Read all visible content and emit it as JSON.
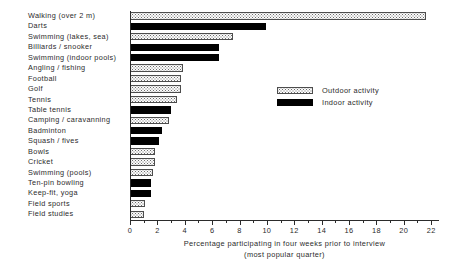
{
  "chart_data": {
    "type": "bar",
    "orientation": "horizontal",
    "title": "",
    "subtitle": "",
    "xlabel_line1": "Percentage participating in four weeks prior to interview",
    "xlabel_line2": "(most popular quarter)",
    "ylabel": "",
    "xlim": [
      0,
      22.5
    ],
    "xticks": [
      0,
      2,
      4,
      6,
      8,
      10,
      12,
      14,
      16,
      18,
      20,
      22
    ],
    "xtick_labels": [
      "0",
      "2",
      "4",
      "6",
      "8",
      "10",
      "12",
      "14",
      "16",
      "18",
      "20",
      "22"
    ],
    "minor_xticks": [
      1,
      3,
      5,
      7,
      9,
      11,
      13,
      15,
      17,
      19,
      21
    ],
    "grid": false,
    "legend_position": "upper right",
    "legend": [
      {
        "label": "Outdoor activity",
        "style": "outdoor"
      },
      {
        "label": "Indoor activity",
        "style": "indoor"
      }
    ],
    "categories": [
      "Walking (over 2 m)",
      "Darts",
      "Swimming (lakes, sea)",
      "Billiards / snooker",
      "Swimming (indoor pools)",
      "Angling / fishing",
      "Football",
      "Golf",
      "Tennis",
      "Table tennis",
      "Camping / caravanning",
      "Badminton",
      "Squash / fives",
      "Bowls",
      "Cricket",
      "Swimming (pools)",
      "Ten-pin bowling",
      "Keep-fit, yoga",
      "Field sports",
      "Field studies"
    ],
    "values": [
      21.6,
      9.9,
      7.5,
      6.5,
      6.5,
      3.9,
      3.7,
      3.7,
      3.4,
      3.0,
      2.85,
      2.35,
      2.15,
      1.85,
      1.85,
      1.65,
      1.55,
      1.55,
      1.1,
      1.05
    ],
    "bar_styles": [
      "outdoor",
      "indoor",
      "outdoor",
      "indoor",
      "indoor",
      "outdoor",
      "outdoor",
      "outdoor",
      "outdoor",
      "indoor",
      "outdoor",
      "indoor",
      "indoor",
      "outdoor",
      "outdoor",
      "outdoor",
      "indoor",
      "indoor",
      "outdoor",
      "outdoor"
    ]
  }
}
